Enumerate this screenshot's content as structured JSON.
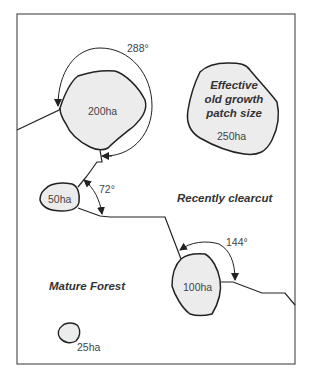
{
  "diagram": {
    "frame_color": "#555555",
    "patch_fill": "#ececec",
    "line_color": "#222222",
    "patches": [
      {
        "id": "200ha",
        "label": "200ha"
      },
      {
        "id": "250ha",
        "title_lines": [
          "Effective",
          "old growth",
          "patch size"
        ],
        "label": "250ha"
      },
      {
        "id": "50ha",
        "label": "50ha"
      },
      {
        "id": "100ha",
        "label": "100ha"
      },
      {
        "id": "25ha",
        "label": "25ha"
      }
    ],
    "angles": [
      {
        "label": "288°"
      },
      {
        "label": "72°"
      },
      {
        "label": "144°"
      }
    ],
    "regions": [
      {
        "label": "Recently clearcut"
      },
      {
        "label": "Mature Forest"
      }
    ]
  }
}
